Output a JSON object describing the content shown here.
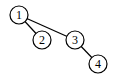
{
  "diagram": {
    "type": "tree",
    "nodes": [
      {
        "id": "1",
        "label": "1",
        "cx": 19,
        "cy": 15,
        "r": 9
      },
      {
        "id": "2",
        "label": "2",
        "cx": 42,
        "cy": 40,
        "r": 9
      },
      {
        "id": "3",
        "label": "3",
        "cx": 75,
        "cy": 40,
        "r": 9
      },
      {
        "id": "4",
        "label": "4",
        "cx": 98,
        "cy": 64,
        "r": 9
      }
    ],
    "edges": [
      {
        "from": "1",
        "to": "2"
      },
      {
        "from": "1",
        "to": "3"
      },
      {
        "from": "3",
        "to": "4"
      }
    ]
  }
}
